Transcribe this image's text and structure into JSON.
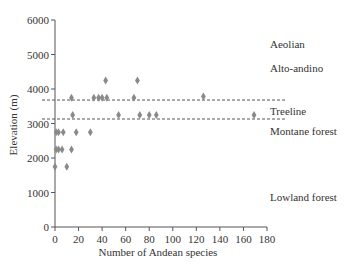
{
  "chart_data": {
    "type": "scatter",
    "title": "",
    "xlabel": "Number of Andean species",
    "ylabel": "Elevation (m)",
    "xlim": [
      0,
      180
    ],
    "ylim": [
      0,
      6000
    ],
    "xticks": [
      0,
      20,
      40,
      60,
      80,
      100,
      120,
      140,
      160,
      180
    ],
    "yticks": [
      0,
      1000,
      2000,
      3000,
      4000,
      5000,
      6000
    ],
    "grid": false,
    "legend": null,
    "marker": "diamond",
    "marker_color": "#8a8a8a",
    "series": [
      {
        "name": "Andean species by elevation",
        "points": [
          {
            "x": 0,
            "y": 1750
          },
          {
            "x": 10,
            "y": 1750
          },
          {
            "x": 1,
            "y": 2250
          },
          {
            "x": 3,
            "y": 2250
          },
          {
            "x": 6,
            "y": 2250
          },
          {
            "x": 14,
            "y": 2250
          },
          {
            "x": 1,
            "y": 2750
          },
          {
            "x": 3,
            "y": 2750
          },
          {
            "x": 7,
            "y": 2750
          },
          {
            "x": 18,
            "y": 2750
          },
          {
            "x": 30,
            "y": 2750
          },
          {
            "x": 15,
            "y": 3250
          },
          {
            "x": 54,
            "y": 3250
          },
          {
            "x": 72,
            "y": 3250
          },
          {
            "x": 80,
            "y": 3250
          },
          {
            "x": 86,
            "y": 3250
          },
          {
            "x": 169,
            "y": 3250
          },
          {
            "x": 14,
            "y": 3750
          },
          {
            "x": 33,
            "y": 3750
          },
          {
            "x": 37,
            "y": 3750
          },
          {
            "x": 40,
            "y": 3750
          },
          {
            "x": 44,
            "y": 3750
          },
          {
            "x": 67,
            "y": 3750
          },
          {
            "x": 126,
            "y": 3780
          },
          {
            "x": 43,
            "y": 4250
          },
          {
            "x": 70,
            "y": 4250
          }
        ]
      }
    ],
    "reference_lines": [
      {
        "y": 3680,
        "style": "dashed",
        "x_end": 197
      },
      {
        "y": 3130,
        "style": "dashed",
        "x_end": 197
      }
    ],
    "annotations": [
      {
        "text": "Aeolian",
        "y_px": 44
      },
      {
        "text": "Alto-andino",
        "y_px": 68
      },
      {
        "text": "Treeline",
        "y_px": 111
      },
      {
        "text": "Montane forest",
        "y_px": 131
      },
      {
        "text": "Lowland forest",
        "y_px": 197
      }
    ]
  }
}
